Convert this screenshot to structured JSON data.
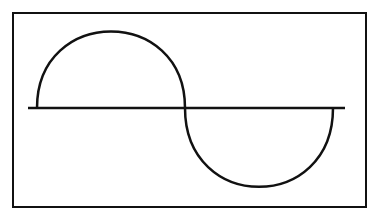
{
  "diagram": {
    "title": "",
    "stroke_color": "#111111",
    "background": "#ffffff",
    "frame": {
      "x": 13,
      "y": 13,
      "width": 353,
      "height": 194
    },
    "axis": {
      "x1": 28,
      "y1": 108,
      "x2": 345,
      "y2": 108
    },
    "positive_half": {
      "x_start": 37,
      "x_end": 185,
      "peak_y": 32
    },
    "negative_half": {
      "x_start": 185,
      "x_end": 333,
      "trough_y": 187
    }
  }
}
